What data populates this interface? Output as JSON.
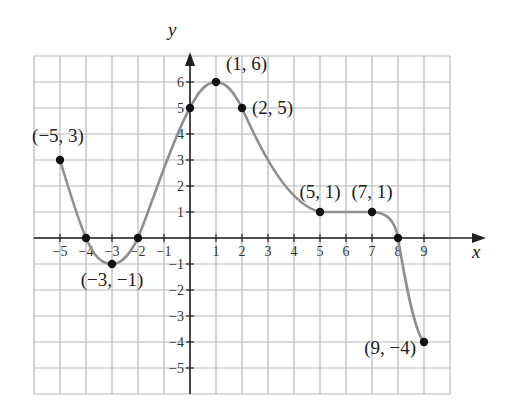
{
  "chart_data": {
    "type": "line",
    "title": "",
    "xlabel": "x",
    "ylabel": "y",
    "xlim": [
      -6,
      10
    ],
    "ylim": [
      -6,
      7
    ],
    "grid": true,
    "legend": null,
    "x_ticks": [
      -5,
      -4,
      -3,
      -2,
      -1,
      1,
      2,
      3,
      4,
      5,
      6,
      7,
      8,
      9
    ],
    "x_tick_labels": [
      "−5",
      "−4",
      "−3",
      "−2",
      "−1",
      "1",
      "2",
      "3",
      "4",
      "5",
      "6",
      "7",
      "8",
      "9"
    ],
    "y_ticks": [
      6,
      5,
      4,
      3,
      2,
      1,
      -1,
      -2,
      -3,
      -4,
      -5
    ],
    "y_tick_labels": [
      "6",
      "5",
      "4",
      "3",
      "2",
      "1",
      "−1",
      "−2",
      "−3",
      "−4",
      "−5"
    ],
    "series": [
      {
        "name": "f(x)",
        "curve_points": [
          [
            -5,
            3
          ],
          [
            -4,
            0
          ],
          [
            -3,
            -1
          ],
          [
            -2,
            0
          ],
          [
            0,
            5
          ],
          [
            1,
            6
          ],
          [
            2,
            5
          ],
          [
            5,
            1
          ],
          [
            7,
            1
          ],
          [
            8,
            0
          ],
          [
            9,
            -4
          ]
        ],
        "marked_points": [
          {
            "x": -5,
            "y": 3,
            "label": "(−5, 3)"
          },
          {
            "x": -4,
            "y": 0,
            "label": ""
          },
          {
            "x": -3,
            "y": -1,
            "label": "(−3, −1)"
          },
          {
            "x": -2,
            "y": 0,
            "label": ""
          },
          {
            "x": 0,
            "y": 5,
            "label": ""
          },
          {
            "x": 1,
            "y": 6,
            "label": "(1, 6)"
          },
          {
            "x": 2,
            "y": 5,
            "label": "(2, 5)"
          },
          {
            "x": 5,
            "y": 1,
            "label": "(5, 1)"
          },
          {
            "x": 7,
            "y": 1,
            "label": "(7, 1)"
          },
          {
            "x": 8,
            "y": 0,
            "label": ""
          },
          {
            "x": 9,
            "y": -4,
            "label": "(9, −4)"
          }
        ]
      }
    ],
    "colors": {
      "curve": "#8f8f8f",
      "points": "#111111",
      "grid": "#b8b8b8",
      "axis": "#222222"
    }
  }
}
